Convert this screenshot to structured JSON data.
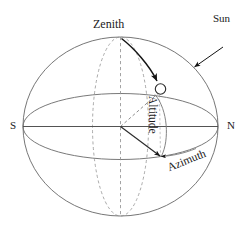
{
  "figure": {
    "background_color": "#ffffff",
    "line_color": "#555555",
    "accent_color": "#1a1a1a",
    "labels": {
      "zenith": "Zenith",
      "sun": "Sun",
      "south": "S",
      "north": "N",
      "altitude": "Altitude",
      "azimuth": "Azimuth"
    },
    "elements": {
      "sphere_outline": "celestial-sphere",
      "horizon_circle": "horizon-plane-ellipse",
      "meridian_circle": "meridian-ellipse",
      "zenith_axis": "zenith-nadir-dashed-axis",
      "horizon_axis": "south-north-axis",
      "sun_marker": "sun-position-circle",
      "sight_line": "observer-to-sun-dashed-line",
      "ground_projection": "observer-to-azimuth-point-line",
      "altitude_arc": "altitude-angle-arc",
      "azimuth_arc": "azimuth-angle-arc",
      "zenith_arrow": "zenith-to-sun-curved-arrow",
      "sun_arrow": "sun-pointer-arrow"
    }
  }
}
